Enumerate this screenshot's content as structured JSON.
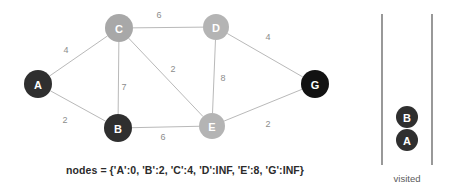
{
  "caption": "nodes = {'A':0, 'B':2, 'C':4, 'D':INF, 'E':8, 'G':INF}",
  "visited_panel": {
    "label": "visited",
    "stack": [
      {
        "id": "B",
        "label": "B",
        "color": "#2f2f2f",
        "cx": 407,
        "cy": 117,
        "r": 11
      },
      {
        "id": "A",
        "label": "A",
        "color": "#2f2f2f",
        "cx": 407,
        "cy": 140,
        "r": 11
      }
    ],
    "rail_left_x": 382,
    "rail_right_x": 432,
    "rail_top_y": 14,
    "rail_bottom_y": 165,
    "label_x": 407,
    "label_y": 178
  },
  "graph": {
    "nodes": [
      {
        "id": "A",
        "label": "A",
        "cx": 38,
        "cy": 84,
        "r": 14,
        "color": "#2f2f2f",
        "state": "visited"
      },
      {
        "id": "B",
        "label": "B",
        "cx": 118,
        "cy": 128,
        "r": 14,
        "color": "#2f2f2f",
        "state": "visited"
      },
      {
        "id": "C",
        "label": "C",
        "cx": 119,
        "cy": 28,
        "r": 14,
        "color": "#a8a8a8",
        "state": "frontier"
      },
      {
        "id": "D",
        "label": "D",
        "cx": 216,
        "cy": 27,
        "r": 13,
        "color": "#b4b4b4",
        "state": "unvisited"
      },
      {
        "id": "E",
        "label": "E",
        "cx": 212,
        "cy": 126,
        "r": 13,
        "color": "#b4b4b4",
        "state": "unvisited"
      },
      {
        "id": "G",
        "label": "G",
        "cx": 315,
        "cy": 84,
        "r": 14,
        "color": "#121212",
        "state": "target"
      }
    ],
    "edges": [
      {
        "from": "A",
        "to": "C",
        "weight": "4",
        "lx": 66,
        "ly": 50
      },
      {
        "from": "A",
        "to": "B",
        "weight": "2",
        "lx": 65,
        "ly": 120
      },
      {
        "from": "C",
        "to": "D",
        "weight": "6",
        "lx": 159,
        "ly": 15
      },
      {
        "from": "C",
        "to": "B",
        "weight": "7",
        "lx": 124,
        "ly": 87
      },
      {
        "from": "C",
        "to": "E",
        "weight": "2",
        "lx": 173,
        "ly": 69
      },
      {
        "from": "D",
        "to": "E",
        "weight": "8",
        "lx": 223,
        "ly": 78
      },
      {
        "from": "D",
        "to": "G",
        "weight": "4",
        "lx": 268,
        "ly": 37
      },
      {
        "from": "B",
        "to": "E",
        "weight": "6",
        "lx": 163,
        "ly": 137
      },
      {
        "from": "E",
        "to": "G",
        "weight": "2",
        "lx": 268,
        "ly": 124
      }
    ]
  }
}
